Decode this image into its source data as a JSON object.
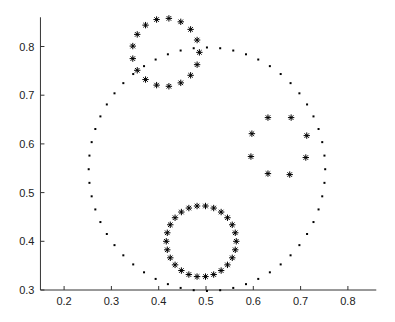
{
  "chart_data": {
    "type": "scatter",
    "title": "",
    "xlabel": "",
    "ylabel": "",
    "xlim": [
      0.15,
      0.86
    ],
    "ylim": [
      0.3,
      0.86
    ],
    "grid": false,
    "legend": null,
    "x_ticks": [
      0.2,
      0.3,
      0.4,
      0.5,
      0.6,
      0.7,
      0.8
    ],
    "x_tick_labels": [
      "0.2",
      "0.3",
      "0.4",
      "0.5",
      "0.6",
      "0.7",
      "0.8"
    ],
    "y_ticks": [
      0.3,
      0.4,
      0.5,
      0.6,
      0.7,
      0.8
    ],
    "y_tick_labels": [
      "0.3",
      "0.4",
      "0.5",
      "0.6",
      "0.7",
      "0.8"
    ],
    "series": [
      {
        "name": "large-dotted-ring",
        "marker": "dot",
        "shape": "circle",
        "center": [
          0.502,
          0.548
        ],
        "radius": [
          0.25,
          0.25
        ],
        "count": 56,
        "color": "#000000"
      },
      {
        "name": "top-star-ring",
        "marker": "star",
        "shape": "circle",
        "center": [
          0.415,
          0.788
        ],
        "radius": [
          0.071,
          0.07
        ],
        "count": 17,
        "color": "#000000"
      },
      {
        "name": "bottom-star-ring",
        "marker": "star",
        "shape": "circle",
        "center": [
          0.49,
          0.4
        ],
        "radius": [
          0.074,
          0.073
        ],
        "count": 26,
        "color": "#000000"
      },
      {
        "name": "right-star-cluster",
        "marker": "star",
        "shape": "points",
        "points": [
          [
            0.631,
            0.654
          ],
          [
            0.68,
            0.654
          ],
          [
            0.597,
            0.621
          ],
          [
            0.713,
            0.617
          ],
          [
            0.595,
            0.574
          ],
          [
            0.711,
            0.572
          ],
          [
            0.631,
            0.539
          ],
          [
            0.677,
            0.537
          ]
        ],
        "color": "#000000"
      }
    ]
  }
}
